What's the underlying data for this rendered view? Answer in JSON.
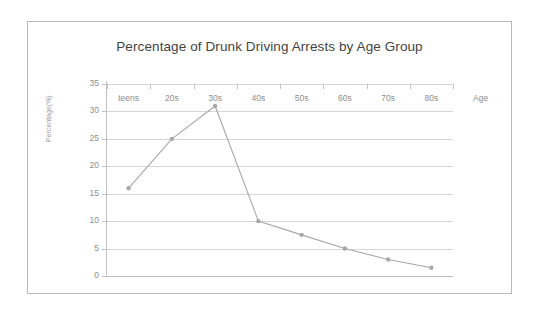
{
  "chart_data": {
    "type": "line",
    "title": "Percentage of Drunk Driving Arrests by Age Group",
    "xlabel": "Age",
    "ylabel": "Percentage(%)",
    "categories": [
      "teens",
      "20s",
      "30s",
      "40s",
      "50s",
      "60s",
      "70s",
      "80s"
    ],
    "series": [
      {
        "name": "Percentage of arrests",
        "values": [
          16,
          25,
          31,
          10,
          7.5,
          5,
          3,
          1.5
        ]
      }
    ],
    "ylim": [
      0,
      35
    ],
    "yticks": [
      0,
      5,
      10,
      15,
      20,
      25,
      30,
      35
    ],
    "ytick_labels": [
      "0",
      "5",
      "10",
      "15",
      "20",
      "25",
      "30",
      "35"
    ],
    "grid": true,
    "legend": false,
    "line_color": "#a8a8a8",
    "marker_color": "#a8a8a8",
    "gridline_color": "#d6d6d6",
    "axis_color": "#c2c2c2",
    "title_color": "#444444",
    "tick_label_color": "#8d8d8d",
    "border_color": "#b9b9b9",
    "background": "#ffffff"
  }
}
